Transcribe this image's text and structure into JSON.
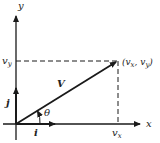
{
  "diagram": {
    "type": "vector-components",
    "axes": {
      "x_label": "x",
      "y_label": "y"
    },
    "unit_vectors": {
      "i_label": "i",
      "j_label": "j"
    },
    "vector": {
      "label": "V",
      "angle_label": "θ",
      "tip_label": "(v",
      "tip_sub_x": "x",
      "tip_comma": ", v",
      "tip_sub_y": "y",
      "tip_close": ")"
    },
    "components": {
      "x_component_label": "v",
      "x_component_sub": "x",
      "y_component_label": "v",
      "y_component_sub": "y"
    },
    "colors": {
      "stroke": "#1a1a1a",
      "background": "#ffffff"
    }
  }
}
